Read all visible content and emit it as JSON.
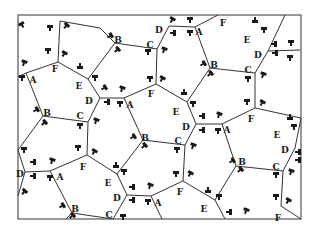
{
  "diagram": {
    "title": "",
    "kind": "pentagonal tiling with labeled vertices and decorative glyph marks",
    "frame": {
      "x": 18,
      "y": 15,
      "w": 283,
      "h": 204,
      "stroke": "#555555"
    },
    "line_color": "#333333",
    "text_color": "#1a1a1a",
    "vertices": {
      "v1": {
        "x": 60,
        "y": 21
      },
      "v2": {
        "x": 58,
        "y": 62
      },
      "v3": {
        "x": 100,
        "y": 28
      },
      "v4": {
        "x": 115,
        "y": 43
      },
      "v5": {
        "x": 157,
        "y": 49
      },
      "v6": {
        "x": 169,
        "y": 26
      },
      "v7": {
        "x": 195,
        "y": 27
      },
      "v8": {
        "x": 218,
        "y": 15
      },
      "v9": {
        "x": 210,
        "y": 68
      },
      "v10": {
        "x": 255,
        "y": 73
      },
      "v11": {
        "x": 268,
        "y": 51
      },
      "v12": {
        "x": 300,
        "y": 50
      },
      "v13": {
        "x": 255,
        "y": 108
      },
      "v14": {
        "x": 156,
        "y": 84
      },
      "v15": {
        "x": 100,
        "y": 98
      },
      "v16": {
        "x": 124,
        "y": 98
      },
      "v17": {
        "x": 88,
        "y": 79
      },
      "v18": {
        "x": 26,
        "y": 73
      },
      "v19": {
        "x": 43,
        "y": 116
      },
      "v20": {
        "x": 88,
        "y": 122
      },
      "v21": {
        "x": 143,
        "y": 140
      },
      "v22": {
        "x": 185,
        "y": 145
      },
      "v23": {
        "x": 196,
        "y": 124
      },
      "v24": {
        "x": 222,
        "y": 124
      },
      "v25": {
        "x": 187,
        "y": 102
      },
      "v26": {
        "x": 87,
        "y": 155
      },
      "v27": {
        "x": 50,
        "y": 171
      },
      "v28": {
        "x": 25,
        "y": 172
      },
      "v29": {
        "x": 18,
        "y": 150
      },
      "v30": {
        "x": 117,
        "y": 174
      },
      "v31": {
        "x": 127,
        "y": 195
      },
      "v32": {
        "x": 151,
        "y": 196
      },
      "v33": {
        "x": 183,
        "y": 181
      },
      "v34": {
        "x": 236,
        "y": 166
      },
      "v35": {
        "x": 283,
        "y": 171
      },
      "v36": {
        "x": 295,
        "y": 148
      },
      "v37": {
        "x": 301,
        "y": 118
      },
      "v38": {
        "x": 72,
        "y": 213
      },
      "v39": {
        "x": 113,
        "y": 219
      },
      "v40": {
        "x": 162,
        "y": 219
      },
      "v41": {
        "x": 215,
        "y": 200
      },
      "v42": {
        "x": 225,
        "y": 219
      },
      "v43": {
        "x": 281,
        "y": 206
      },
      "v44": {
        "x": 301,
        "y": 219
      },
      "v45": {
        "x": 66,
        "y": 219
      },
      "v46": {
        "x": 18,
        "y": 77
      },
      "v47": {
        "x": 18,
        "y": 196
      },
      "v48": {
        "x": 285,
        "y": 15
      }
    },
    "edges": [
      [
        "v1",
        "v3"
      ],
      [
        "v1",
        "v2"
      ],
      [
        "v3",
        "v4"
      ],
      [
        "v4",
        "v5"
      ],
      [
        "v5",
        "v6"
      ],
      [
        "v6",
        "v7"
      ],
      [
        "v7",
        "v8"
      ],
      [
        "v7",
        "v9"
      ],
      [
        "v9",
        "v10"
      ],
      [
        "v10",
        "v11"
      ],
      [
        "v11",
        "v12"
      ],
      [
        "v11",
        "v48"
      ],
      [
        "v10",
        "v13"
      ],
      [
        "v5",
        "v14"
      ],
      [
        "v14",
        "v16"
      ],
      [
        "v16",
        "v15"
      ],
      [
        "v15",
        "v17"
      ],
      [
        "v17",
        "v4"
      ],
      [
        "v17",
        "v2"
      ],
      [
        "v2",
        "v18"
      ],
      [
        "v18",
        "v46"
      ],
      [
        "v18",
        "v19"
      ],
      [
        "v19",
        "v20"
      ],
      [
        "v20",
        "v15"
      ],
      [
        "v14",
        "v25"
      ],
      [
        "v25",
        "v9"
      ],
      [
        "v25",
        "v23"
      ],
      [
        "v23",
        "v24"
      ],
      [
        "v24",
        "v13"
      ],
      [
        "v16",
        "v21"
      ],
      [
        "v21",
        "v22"
      ],
      [
        "v22",
        "v23"
      ],
      [
        "v20",
        "v26"
      ],
      [
        "v26",
        "v27"
      ],
      [
        "v27",
        "v28"
      ],
      [
        "v28",
        "v29"
      ],
      [
        "v28",
        "v47"
      ],
      [
        "v19",
        "v29"
      ],
      [
        "v26",
        "v30"
      ],
      [
        "v30",
        "v21"
      ],
      [
        "v30",
        "v31"
      ],
      [
        "v31",
        "v32"
      ],
      [
        "v32",
        "v33"
      ],
      [
        "v33",
        "v22"
      ],
      [
        "v24",
        "v34"
      ],
      [
        "v34",
        "v35"
      ],
      [
        "v35",
        "v36"
      ],
      [
        "v36",
        "v37"
      ],
      [
        "v13",
        "v37"
      ],
      [
        "v27",
        "v38"
      ],
      [
        "v38",
        "v39"
      ],
      [
        "v39",
        "v31"
      ],
      [
        "v32",
        "v40"
      ],
      [
        "v33",
        "v41"
      ],
      [
        "v41",
        "v34"
      ],
      [
        "v41",
        "v42"
      ],
      [
        "v35",
        "v43"
      ],
      [
        "v43",
        "v44"
      ],
      [
        "v38",
        "v45"
      ]
    ],
    "labels": [
      {
        "text": "B",
        "x": 118,
        "y": 40
      },
      {
        "text": "C",
        "x": 150,
        "y": 45
      },
      {
        "text": "D",
        "x": 159,
        "y": 30
      },
      {
        "text": "A",
        "x": 199,
        "y": 32
      },
      {
        "text": "F",
        "x": 223,
        "y": 23
      },
      {
        "text": "E",
        "x": 247,
        "y": 40
      },
      {
        "text": "D",
        "x": 258,
        "y": 55
      },
      {
        "text": "F",
        "x": 55,
        "y": 69
      },
      {
        "text": "A",
        "x": 33,
        "y": 80
      },
      {
        "text": "E",
        "x": 79,
        "y": 86
      },
      {
        "text": "D",
        "x": 89,
        "y": 101
      },
      {
        "text": "A",
        "x": 130,
        "y": 105
      },
      {
        "text": "F",
        "x": 151,
        "y": 94
      },
      {
        "text": "B",
        "x": 214,
        "y": 65
      },
      {
        "text": "C",
        "x": 248,
        "y": 70
      },
      {
        "text": "B",
        "x": 47,
        "y": 113
      },
      {
        "text": "C",
        "x": 80,
        "y": 116
      },
      {
        "text": "E",
        "x": 176,
        "y": 112
      },
      {
        "text": "D",
        "x": 186,
        "y": 127
      },
      {
        "text": "A",
        "x": 227,
        "y": 130
      },
      {
        "text": "F",
        "x": 251,
        "y": 119
      },
      {
        "text": "E",
        "x": 277,
        "y": 135
      },
      {
        "text": "D",
        "x": 285,
        "y": 150
      },
      {
        "text": "B",
        "x": 145,
        "y": 138
      },
      {
        "text": "C",
        "x": 178,
        "y": 141
      },
      {
        "text": "D",
        "x": 20,
        "y": 174
      },
      {
        "text": "A",
        "x": 60,
        "y": 177
      },
      {
        "text": "F",
        "x": 83,
        "y": 167
      },
      {
        "text": "B",
        "x": 242,
        "y": 162
      },
      {
        "text": "C",
        "x": 276,
        "y": 167
      },
      {
        "text": "E",
        "x": 108,
        "y": 183
      },
      {
        "text": "D",
        "x": 117,
        "y": 198
      },
      {
        "text": "A",
        "x": 158,
        "y": 203
      },
      {
        "text": "F",
        "x": 180,
        "y": 192
      },
      {
        "text": "B",
        "x": 75,
        "y": 209
      },
      {
        "text": "C",
        "x": 109,
        "y": 215
      },
      {
        "text": "E",
        "x": 204,
        "y": 209
      },
      {
        "text": "F",
        "x": 278,
        "y": 218
      }
    ],
    "glyph_marks": [
      {
        "x": 22,
        "y": 25,
        "r": -30
      },
      {
        "x": 50,
        "y": 28,
        "r": 0
      },
      {
        "x": 66,
        "y": 26,
        "r": 40
      },
      {
        "x": 48,
        "y": 51,
        "r": 0
      },
      {
        "x": 64,
        "y": 54,
        "r": 30
      },
      {
        "x": 24,
        "y": 63,
        "r": 20
      },
      {
        "x": 22,
        "y": 78,
        "r": 0
      },
      {
        "x": 80,
        "y": 66,
        "r": 180
      },
      {
        "x": 95,
        "y": 78,
        "r": 0
      },
      {
        "x": 110,
        "y": 36,
        "r": 60
      },
      {
        "x": 117,
        "y": 50,
        "r": 50
      },
      {
        "x": 148,
        "y": 52,
        "r": 0
      },
      {
        "x": 164,
        "y": 50,
        "r": 20
      },
      {
        "x": 172,
        "y": 20,
        "r": 30
      },
      {
        "x": 190,
        "y": 20,
        "r": 0
      },
      {
        "x": 173,
        "y": 33,
        "r": 90
      },
      {
        "x": 190,
        "y": 33,
        "r": 0
      },
      {
        "x": 255,
        "y": 20,
        "r": 180
      },
      {
        "x": 264,
        "y": 30,
        "r": 0
      },
      {
        "x": 274,
        "y": 44,
        "r": 90
      },
      {
        "x": 291,
        "y": 43,
        "r": 0
      },
      {
        "x": 275,
        "y": 53,
        "r": 90
      },
      {
        "x": 290,
        "y": 58,
        "r": 0
      },
      {
        "x": 203,
        "y": 64,
        "r": 60
      },
      {
        "x": 210,
        "y": 74,
        "r": 50
      },
      {
        "x": 248,
        "y": 79,
        "r": 0
      },
      {
        "x": 263,
        "y": 75,
        "r": 20
      },
      {
        "x": 150,
        "y": 79,
        "r": 0
      },
      {
        "x": 162,
        "y": 79,
        "r": 30
      },
      {
        "x": 104,
        "y": 88,
        "r": 60
      },
      {
        "x": 122,
        "y": 89,
        "r": 20
      },
      {
        "x": 107,
        "y": 102,
        "r": 90
      },
      {
        "x": 120,
        "y": 104,
        "r": 0
      },
      {
        "x": 184,
        "y": 92,
        "r": 180
      },
      {
        "x": 193,
        "y": 104,
        "r": 0
      },
      {
        "x": 36,
        "y": 110,
        "r": 60
      },
      {
        "x": 44,
        "y": 123,
        "r": 50
      },
      {
        "x": 80,
        "y": 126,
        "r": 0
      },
      {
        "x": 96,
        "y": 121,
        "r": 20
      },
      {
        "x": 202,
        "y": 116,
        "r": 90
      },
      {
        "x": 219,
        "y": 115,
        "r": 20
      },
      {
        "x": 202,
        "y": 130,
        "r": 90
      },
      {
        "x": 218,
        "y": 131,
        "r": 0
      },
      {
        "x": 247,
        "y": 102,
        "r": 0
      },
      {
        "x": 262,
        "y": 103,
        "r": 30
      },
      {
        "x": 290,
        "y": 117,
        "r": 180
      },
      {
        "x": 294,
        "y": 127,
        "r": 0
      },
      {
        "x": 133,
        "y": 137,
        "r": 60
      },
      {
        "x": 144,
        "y": 146,
        "r": 50
      },
      {
        "x": 177,
        "y": 150,
        "r": 0
      },
      {
        "x": 193,
        "y": 146,
        "r": 20
      },
      {
        "x": 24,
        "y": 150,
        "r": 0
      },
      {
        "x": 78,
        "y": 148,
        "r": 0
      },
      {
        "x": 94,
        "y": 152,
        "r": 30
      },
      {
        "x": 33,
        "y": 162,
        "r": 90
      },
      {
        "x": 52,
        "y": 161,
        "r": 20
      },
      {
        "x": 33,
        "y": 176,
        "r": 90
      },
      {
        "x": 50,
        "y": 178,
        "r": 0
      },
      {
        "x": 116,
        "y": 165,
        "r": 180
      },
      {
        "x": 124,
        "y": 172,
        "r": 0
      },
      {
        "x": 232,
        "y": 161,
        "r": 60
      },
      {
        "x": 240,
        "y": 170,
        "r": 50
      },
      {
        "x": 276,
        "y": 175,
        "r": 0
      },
      {
        "x": 291,
        "y": 172,
        "r": 20
      },
      {
        "x": 298,
        "y": 152,
        "r": 90
      },
      {
        "x": 298,
        "y": 160,
        "r": 90
      },
      {
        "x": 132,
        "y": 187,
        "r": 90
      },
      {
        "x": 150,
        "y": 186,
        "r": 20
      },
      {
        "x": 132,
        "y": 200,
        "r": 90
      },
      {
        "x": 148,
        "y": 202,
        "r": 0
      },
      {
        "x": 176,
        "y": 174,
        "r": 0
      },
      {
        "x": 190,
        "y": 174,
        "r": 30
      },
      {
        "x": 24,
        "y": 192,
        "r": 40
      },
      {
        "x": 62,
        "y": 206,
        "r": 60
      },
      {
        "x": 72,
        "y": 216,
        "r": 50
      },
      {
        "x": 208,
        "y": 190,
        "r": 180
      },
      {
        "x": 219,
        "y": 197,
        "r": 0
      },
      {
        "x": 229,
        "y": 212,
        "r": 90
      },
      {
        "x": 246,
        "y": 211,
        "r": 20
      },
      {
        "x": 276,
        "y": 197,
        "r": 0
      },
      {
        "x": 288,
        "y": 201,
        "r": 30
      },
      {
        "x": 123,
        "y": 217,
        "r": 0
      }
    ]
  }
}
